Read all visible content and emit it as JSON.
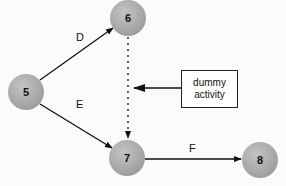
{
  "diagram": {
    "type": "activity-on-arrow network",
    "nodes": [
      {
        "id": "5",
        "label": "5",
        "x": 26,
        "y": 92
      },
      {
        "id": "6",
        "label": "6",
        "x": 128,
        "y": 18
      },
      {
        "id": "7",
        "label": "7",
        "x": 127,
        "y": 158
      },
      {
        "id": "8",
        "label": "8",
        "x": 260,
        "y": 160
      }
    ],
    "edges": [
      {
        "from": "5",
        "to": "6",
        "label": "D",
        "style": "solid"
      },
      {
        "from": "5",
        "to": "7",
        "label": "E",
        "style": "solid"
      },
      {
        "from": "6",
        "to": "7",
        "label": "",
        "style": "dotted"
      },
      {
        "from": "7",
        "to": "8",
        "label": "F",
        "style": "solid"
      }
    ],
    "callout": {
      "line1": "dummy",
      "line2": "activity",
      "points_to": "edge 6-7"
    }
  }
}
